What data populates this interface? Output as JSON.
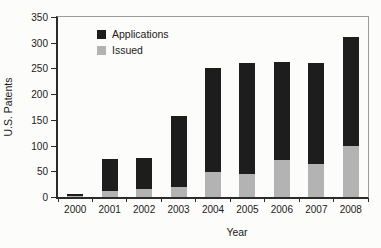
{
  "figure": {
    "background": "#fcfcfa",
    "ylabel": "U.S. Patents",
    "xlabel": "Year",
    "legend_items": [
      {
        "label": "Applications",
        "color": "#1d1d1d"
      },
      {
        "label": "Issued",
        "color": "#b3b3b3"
      }
    ]
  },
  "chart_data": {
    "type": "bar",
    "stacked": true,
    "title": "",
    "xlabel": "Year",
    "ylabel": "U.S. Patents",
    "ylim": [
      0,
      350
    ],
    "yticks": [
      0,
      50,
      100,
      150,
      200,
      250,
      300,
      350
    ],
    "grid": false,
    "legend_position": "upper-left-inside",
    "categories": [
      "2000",
      "2001",
      "2002",
      "2003",
      "2004",
      "2005",
      "2006",
      "2007",
      "2008"
    ],
    "series": [
      {
        "name": "Issued",
        "color": "#b3b3b3",
        "values": [
          1,
          12,
          15,
          20,
          48,
          45,
          72,
          65,
          100
        ]
      },
      {
        "name": "Applications",
        "color": "#1d1d1d",
        "values": [
          4,
          61,
          61,
          138,
          203,
          215,
          191,
          196,
          212
        ]
      }
    ]
  }
}
